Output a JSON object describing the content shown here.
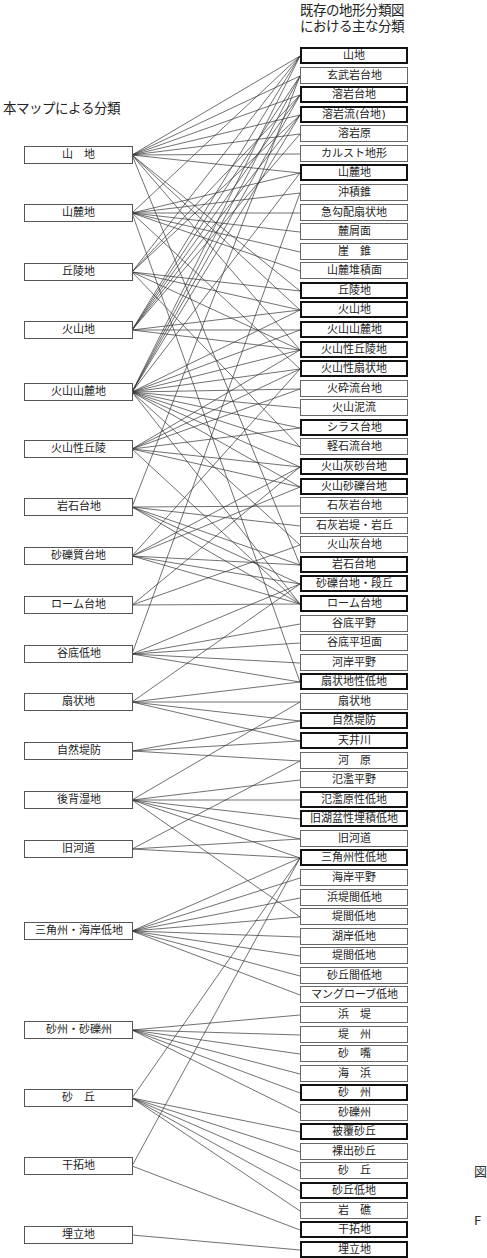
{
  "header": {
    "right_title_line1": "既存の地形分類図",
    "right_title_line2": "における主な分類",
    "left_title": "本マップによる分類"
  },
  "left_items": [
    {
      "label": "山　地",
      "y": 155
    },
    {
      "label": "山麓地",
      "y": 213
    },
    {
      "label": "丘陵地",
      "y": 272
    },
    {
      "label": "火山地",
      "y": 330
    },
    {
      "label": "火山山麓地",
      "y": 392
    },
    {
      "label": "火山性丘陵",
      "y": 449
    },
    {
      "label": "岩石台地",
      "y": 507
    },
    {
      "label": "砂礫質台地",
      "y": 556
    },
    {
      "label": "ローム台地",
      "y": 605
    },
    {
      "label": "谷底低地",
      "y": 654
    },
    {
      "label": "扇状地",
      "y": 702
    },
    {
      "label": "自然堤防",
      "y": 751
    },
    {
      "label": "後背湿地",
      "y": 800
    },
    {
      "label": "旧河道",
      "y": 849
    },
    {
      "label": "三角州・海岸低地",
      "y": 931
    },
    {
      "label": "砂州・砂礫州",
      "y": 1030
    },
    {
      "label": "砂　丘",
      "y": 1098
    },
    {
      "label": "干拓地",
      "y": 1166
    },
    {
      "label": "埋立地",
      "y": 1235
    }
  ],
  "right_items": [
    {
      "label": "山地",
      "bold": true
    },
    {
      "label": "玄武岩台地",
      "bold": false
    },
    {
      "label": "溶岩台地",
      "bold": true
    },
    {
      "label": "溶岩流(台地)",
      "bold": true
    },
    {
      "label": "溶岩原",
      "bold": false
    },
    {
      "label": "カルスト地形",
      "bold": false
    },
    {
      "label": "山麓地",
      "bold": true
    },
    {
      "label": "沖積錐",
      "bold": false
    },
    {
      "label": "急勾配扇状地",
      "bold": false
    },
    {
      "label": "麓屑面",
      "bold": false
    },
    {
      "label": "崖　錐",
      "bold": false
    },
    {
      "label": "山麓堆積面",
      "bold": false
    },
    {
      "label": "丘陵地",
      "bold": true
    },
    {
      "label": "火山地",
      "bold": true
    },
    {
      "label": "火山山麓地",
      "bold": true
    },
    {
      "label": "火山性丘陵地",
      "bold": true
    },
    {
      "label": "火山性扇状地",
      "bold": true
    },
    {
      "label": "火砕流台地",
      "bold": false
    },
    {
      "label": "火山泥流",
      "bold": false
    },
    {
      "label": "シラス台地",
      "bold": true
    },
    {
      "label": "軽石流台地",
      "bold": false
    },
    {
      "label": "火山灰砂台地",
      "bold": true
    },
    {
      "label": "火山砂礫台地",
      "bold": true
    },
    {
      "label": "石灰岩台地",
      "bold": false
    },
    {
      "label": "石灰岩堤・岩丘",
      "bold": false
    },
    {
      "label": "火山灰台地",
      "bold": false
    },
    {
      "label": "岩石台地",
      "bold": true
    },
    {
      "label": "砂礫台地・段丘",
      "bold": true
    },
    {
      "label": "ローム台地",
      "bold": true
    },
    {
      "label": "谷底平野",
      "bold": false
    },
    {
      "label": "谷底平坦面",
      "bold": false
    },
    {
      "label": "河岸平野",
      "bold": false
    },
    {
      "label": "扇状地性低地",
      "bold": true
    },
    {
      "label": "扇状地",
      "bold": false
    },
    {
      "label": "自然堤防",
      "bold": true
    },
    {
      "label": "天井川",
      "bold": true
    },
    {
      "label": "河　原",
      "bold": false
    },
    {
      "label": "氾濫平野",
      "bold": false
    },
    {
      "label": "氾濫原性低地",
      "bold": true
    },
    {
      "label": "旧湖盆性埋積低地",
      "bold": true
    },
    {
      "label": "旧河道",
      "bold": false
    },
    {
      "label": "三角州性低地",
      "bold": true
    },
    {
      "label": "海岸平野",
      "bold": false
    },
    {
      "label": "浜堤間低地",
      "bold": false
    },
    {
      "label": "堤間低地",
      "bold": false
    },
    {
      "label": "湖岸低地",
      "bold": false
    },
    {
      "label": "堤間低地",
      "bold": false
    },
    {
      "label": "砂丘間低地",
      "bold": false
    },
    {
      "label": "マングローブ低地",
      "bold": false
    },
    {
      "label": "浜　堤",
      "bold": false
    },
    {
      "label": "堤　州",
      "bold": false
    },
    {
      "label": "砂　嘴",
      "bold": false
    },
    {
      "label": "海　浜",
      "bold": false
    },
    {
      "label": "砂　州",
      "bold": true
    },
    {
      "label": "砂礫州",
      "bold": false
    },
    {
      "label": "被覆砂丘",
      "bold": true
    },
    {
      "label": "裸出砂丘",
      "bold": false
    },
    {
      "label": "砂　丘",
      "bold": false
    },
    {
      "label": "砂丘低地",
      "bold": true
    },
    {
      "label": "岩　礁",
      "bold": false
    },
    {
      "label": "干拓地",
      "bold": true
    },
    {
      "label": "埋立地",
      "bold": true
    }
  ],
  "connections": [
    [
      0,
      [
        0,
        1,
        2,
        3,
        4,
        5,
        6,
        12,
        13,
        15,
        26
      ]
    ],
    [
      1,
      [
        0,
        6,
        7,
        8,
        9,
        10,
        11,
        16,
        32
      ]
    ],
    [
      2,
      [
        0,
        2,
        3,
        12,
        13,
        15,
        20
      ]
    ],
    [
      3,
      [
        0,
        1,
        2,
        3,
        4,
        13,
        14,
        15
      ]
    ],
    [
      4,
      [
        0,
        1,
        2,
        3,
        6,
        13,
        14,
        15,
        16,
        17,
        18,
        19,
        20,
        21,
        22,
        25,
        28
      ]
    ],
    [
      5,
      [
        15,
        16,
        17,
        19,
        21,
        22,
        28
      ]
    ],
    [
      6,
      [
        23,
        24,
        26,
        27,
        28,
        1
      ]
    ],
    [
      7,
      [
        16,
        21,
        22,
        26,
        27,
        28
      ]
    ],
    [
      8,
      [
        21,
        25,
        28
      ]
    ],
    [
      9,
      [
        27,
        29,
        30,
        31,
        32,
        7
      ]
    ],
    [
      10,
      [
        27,
        32,
        33,
        34,
        35
      ]
    ],
    [
      11,
      [
        34,
        35,
        36
      ]
    ],
    [
      12,
      [
        33,
        37,
        38,
        39,
        40,
        41,
        44
      ]
    ],
    [
      13,
      [
        36,
        40,
        41
      ]
    ],
    [
      14,
      [
        41,
        42,
        43,
        44,
        45,
        46,
        47,
        48
      ]
    ],
    [
      15,
      [
        49,
        50,
        51,
        52,
        53,
        54
      ]
    ],
    [
      16,
      [
        41,
        55,
        56,
        57,
        58,
        59
      ]
    ],
    [
      17,
      [
        41,
        60
      ]
    ],
    [
      18,
      [
        61
      ]
    ]
  ],
  "side_text": {
    "a": "図",
    "b": "F"
  }
}
